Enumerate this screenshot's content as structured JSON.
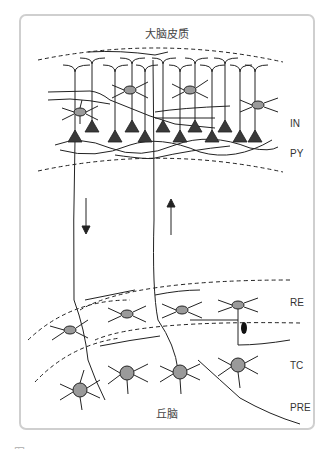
{
  "figure": {
    "top_title": "大脑皮质",
    "bottom_title": "丘脑",
    "labels": {
      "in": "IN",
      "py": "PY",
      "re": "RE",
      "tc": "TC",
      "pre": "PRE"
    },
    "arrows": [
      {
        "name": "descending-arrow",
        "direction": "down"
      },
      {
        "name": "ascending-arrow",
        "direction": "up"
      }
    ],
    "caption_partial": "图 ─── ─ ─ ─ ─ ─ ─ ─ ─ ─ ─ ─ ─ ─ ─ ─ ─ ─ ─ ─ ─ ─ ─ ─ ─",
    "colors": {
      "frame": "#cfcfcf",
      "line": "#222222",
      "interneuron_fill": "#9a9a9a",
      "pyramidal_fill": "#3a3a3a"
    }
  }
}
